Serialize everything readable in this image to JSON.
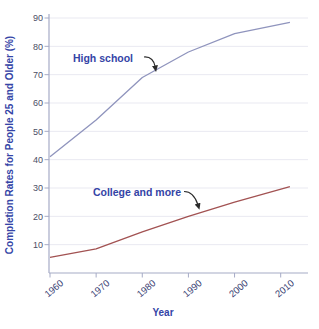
{
  "chart_data": {
    "type": "line",
    "title": "",
    "xlabel": "Year",
    "ylabel": "Completion Rates for People 25 and Older (%)",
    "xlim": [
      1960,
      2016
    ],
    "ylim": [
      0,
      90
    ],
    "x_ticks": [
      1960,
      1970,
      1980,
      1990,
      2000,
      2010
    ],
    "y_ticks": [
      10,
      20,
      30,
      40,
      50,
      60,
      70,
      80,
      90
    ],
    "grid": true,
    "legend_position": "none",
    "series": [
      {
        "name": "High school",
        "color": "#8f94bd",
        "points": [
          [
            1960,
            41
          ],
          [
            1970,
            54
          ],
          [
            1980,
            69
          ],
          [
            1990,
            78
          ],
          [
            2000,
            84.5
          ],
          [
            2012,
            88.5
          ]
        ]
      },
      {
        "name": "College and more",
        "color": "#a25252",
        "points": [
          [
            1960,
            5.5
          ],
          [
            1970,
            8.5
          ],
          [
            1980,
            14.5
          ],
          [
            1990,
            20
          ],
          [
            2000,
            25
          ],
          [
            2012,
            30.5
          ]
        ]
      }
    ],
    "annotations": [
      {
        "label": "High school"
      },
      {
        "label": "College and more"
      }
    ]
  },
  "colors": {
    "background": "#ffffff",
    "gridline": "#e9e9f1",
    "axis_line": "#a6abc6",
    "tick_mark": "#a6abc6",
    "y_tick_label": "#4a4e66",
    "x_tick_label": "#3a4274",
    "axis_title": "#3444a6",
    "annotation_text": "#3444a6",
    "arrow": "#2a2a2a"
  }
}
